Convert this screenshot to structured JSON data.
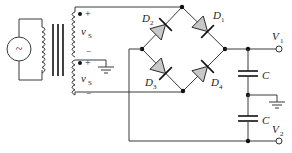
{
  "diagram": {
    "type": "full-wave bridge rectifier with center-tapped transformer and split capacitors",
    "source": {
      "symbol": "~"
    },
    "transformer": {
      "secondary_windings": [
        {
          "label": "v",
          "subscript": "S",
          "plus": "+",
          "minus": "−"
        },
        {
          "label": "v",
          "subscript": "S",
          "plus": "+",
          "minus": "−"
        }
      ]
    },
    "diodes": [
      {
        "label": "D",
        "subscript": "2"
      },
      {
        "label": "D",
        "subscript": "1"
      },
      {
        "label": "D",
        "subscript": "3"
      },
      {
        "label": "D",
        "subscript": "4"
      }
    ],
    "capacitors": [
      {
        "label": "C"
      },
      {
        "label": "C"
      }
    ],
    "outputs": [
      {
        "label": "V",
        "subscript": "1"
      },
      {
        "label": "V",
        "subscript": "2"
      }
    ],
    "colors": {
      "wire": "#3a3a3a",
      "diode_fill": "#c8c8c8",
      "background": "#ffffff"
    }
  }
}
